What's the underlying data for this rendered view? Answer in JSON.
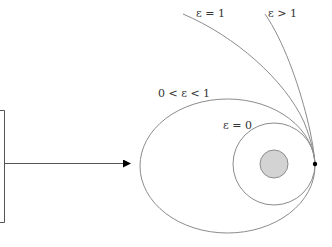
{
  "diagram": {
    "labels": {
      "parabola": "ε = 1",
      "hyperbola": "ε > 1",
      "ellipse": "0 < ε < 1",
      "circle": "ε = 0"
    },
    "colors": {
      "orbit_stroke": "#8c8c8c",
      "planet_fill": "#d3d3d3",
      "planet_stroke": "#8c8c8c",
      "periapsis_dot": "#000000",
      "arrow": "#000000",
      "launcher_box": "#555555"
    },
    "elements": {
      "launcher_box": "launcher-box",
      "arrow": "launch-arrow",
      "planet": "central-body",
      "periapsis": "periapsis-point"
    }
  }
}
